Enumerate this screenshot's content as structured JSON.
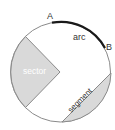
{
  "diagram": {
    "labels": {
      "point_a": "A",
      "point_b": "B",
      "arc": "arc",
      "sector": "sector",
      "segment": "segment"
    },
    "colors": {
      "circle_stroke": "#8a8a8a",
      "shaded_fill": "#d9d9d9",
      "arc_stroke": "#1a1a1a",
      "label_dark": "#333333",
      "label_light": "#ffffff"
    }
  }
}
